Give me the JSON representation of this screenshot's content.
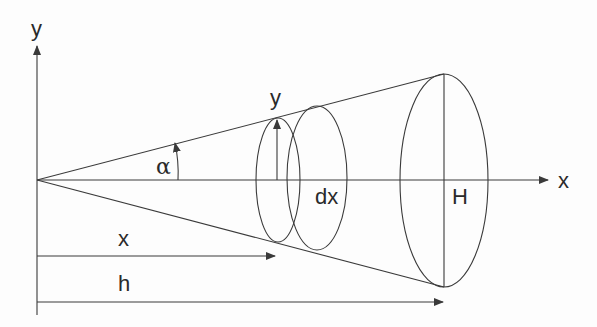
{
  "diagram": {
    "labels": {
      "y_axis": "y",
      "x_axis": "x",
      "alpha": "α",
      "radius_y": "y",
      "dx": "dx",
      "H": "H",
      "x_dist": "x",
      "h_dist": "h"
    },
    "colors": {
      "stroke": "#3a3a3a",
      "text": "#2a2a2a",
      "background": "#fdfdfd"
    }
  }
}
